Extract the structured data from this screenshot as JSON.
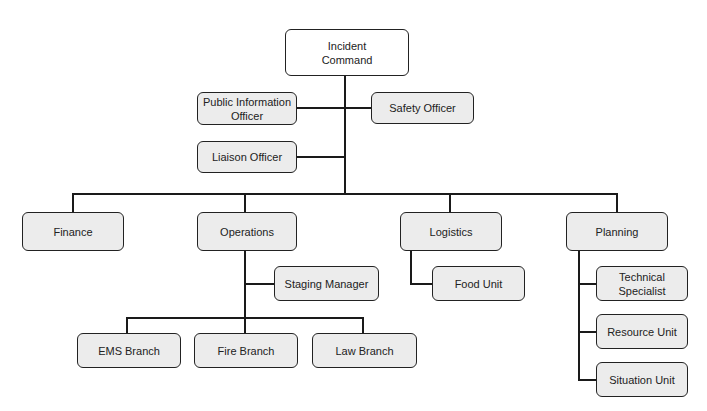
{
  "diagram": {
    "type": "organizational chart",
    "colors": {
      "line": "#1a1a1a",
      "box_fill": "#ececec",
      "root_fill": "#ffffff",
      "border": "#222222"
    },
    "root": {
      "label": "Incident Command"
    },
    "command_staff": [
      {
        "label": "Public Information Officer"
      },
      {
        "label": "Safety Officer"
      },
      {
        "label": "Liaison Officer"
      }
    ],
    "sections": [
      {
        "label": "Finance",
        "children": []
      },
      {
        "label": "Operations",
        "children": [
          {
            "label": "Staging Manager"
          },
          {
            "label": "EMS Branch"
          },
          {
            "label": "Fire Branch"
          },
          {
            "label": "Law Branch"
          }
        ]
      },
      {
        "label": "Logistics",
        "children": [
          {
            "label": "Food Unit"
          }
        ]
      },
      {
        "label": "Planning",
        "children": [
          {
            "label": "Technical Specialist"
          },
          {
            "label": "Resource Unit"
          },
          {
            "label": "Situation Unit"
          }
        ]
      }
    ]
  }
}
